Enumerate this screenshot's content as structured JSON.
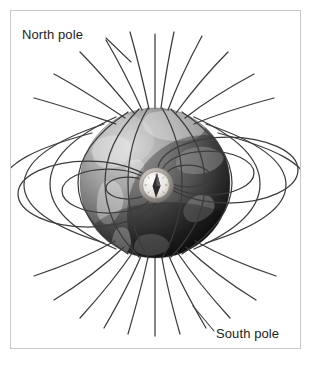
{
  "figure": {
    "background_color": "#ffffff",
    "frame_color": "#c9c9c9",
    "line_color": "#3a3a3a",
    "text_color": "#1d1d1d"
  },
  "labels": {
    "north_pole": "North pole",
    "south_pole": "South pole"
  },
  "globe": {
    "name": "earth-globe",
    "center_x": 155,
    "center_y": 183,
    "radius": 75,
    "light_gray": "#b4b4b4",
    "mid_gray": "#8a8a8a",
    "dark_gray": "#2b2b2b"
  },
  "compass": {
    "name": "compass",
    "center_x": 156,
    "center_y": 185,
    "radius": 16,
    "dial_color": "#eceae6",
    "ring_color": "#9a9a9a",
    "needle_color": "#2b2b2b"
  },
  "field_lines": {
    "count": 24,
    "loop_count": 6,
    "description": "magnetic field lines radiating from poles and looping around equator"
  }
}
